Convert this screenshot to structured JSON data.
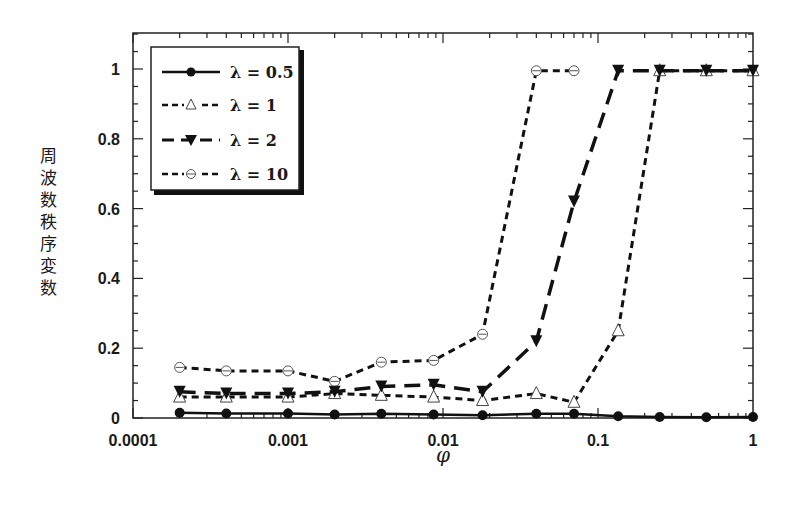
{
  "chart_data": {
    "type": "line",
    "title": "",
    "xlabel": "φ",
    "ylabel": "周波数秩序変数",
    "xscale": "log",
    "xlim": [
      0.0001,
      1
    ],
    "ylim": [
      0,
      1.1
    ],
    "grid": false,
    "legend_position": "upper left",
    "x_ticks": [
      {
        "value": 0.0001,
        "label": "0.0001"
      },
      {
        "value": 0.001,
        "label": "0.001"
      },
      {
        "value": 0.01,
        "label": "0.01"
      },
      {
        "value": 0.1,
        "label": "0.1"
      },
      {
        "value": 1,
        "label": "1"
      }
    ],
    "y_ticks": [
      {
        "value": 0,
        "label": "0"
      },
      {
        "value": 0.2,
        "label": "0.2"
      },
      {
        "value": 0.4,
        "label": "0.4"
      },
      {
        "value": 0.6,
        "label": "0.6"
      },
      {
        "value": 0.8,
        "label": "0.8"
      },
      {
        "value": 1,
        "label": "1"
      }
    ],
    "x": [
      0.0002,
      0.0004,
      0.001,
      0.002,
      0.004,
      0.0087,
      0.018,
      0.04,
      0.07,
      0.135,
      0.25,
      0.5,
      1
    ],
    "series": [
      {
        "name": "λ = 0.5",
        "label": "λ = 0.5",
        "marker": "filled-circle",
        "linestyle": "solid",
        "values": [
          0.015,
          0.013,
          0.013,
          0.01,
          0.012,
          0.01,
          0.008,
          0.012,
          0.012,
          0.005,
          0.003,
          0.002,
          0.003
        ]
      },
      {
        "name": "λ = 1",
        "label": "λ = 1",
        "marker": "open-triangle",
        "linestyle": "dashed",
        "values": [
          0.06,
          0.06,
          0.06,
          0.07,
          0.065,
          0.06,
          0.05,
          0.07,
          0.045,
          0.25,
          0.995,
          0.995,
          0.995
        ]
      },
      {
        "name": "λ = 2",
        "label": "λ = 2",
        "marker": "filled-down-triangle",
        "linestyle": "long-dash",
        "values": [
          0.075,
          0.07,
          0.07,
          0.075,
          0.09,
          0.095,
          0.075,
          0.22,
          0.62,
          0.995,
          0.995,
          0.995,
          0.995
        ]
      },
      {
        "name": "λ = 10",
        "label": "λ = 10",
        "marker": "open-circle",
        "linestyle": "dashed",
        "x": [
          0.0002,
          0.0004,
          0.001,
          0.002,
          0.004,
          0.0087,
          0.018,
          0.04,
          0.07
        ],
        "values": [
          0.145,
          0.135,
          0.135,
          0.105,
          0.16,
          0.165,
          0.24,
          0.995,
          0.995
        ]
      }
    ]
  },
  "legend": {
    "items": [
      {
        "label": "λ = 0.5"
      },
      {
        "label": "λ = 1"
      },
      {
        "label": "λ = 2"
      },
      {
        "label": "λ = 10"
      }
    ]
  },
  "axes": {
    "xlabel": "φ",
    "ylabel": "周波数秩序変数"
  }
}
